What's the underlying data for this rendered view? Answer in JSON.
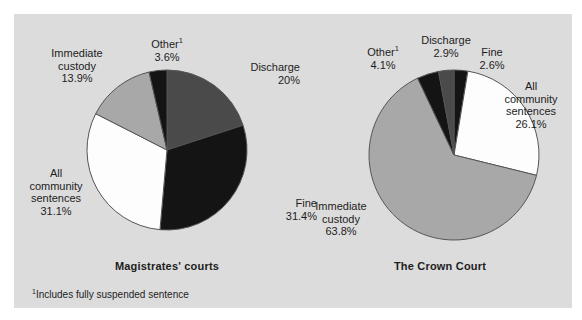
{
  "figure": {
    "background_color": "#dcdcdc",
    "page_color": "#ffffff",
    "footnote_marker": "1",
    "footnote_text": "Includes fully suspended sentence"
  },
  "palette": {
    "black": "#141414",
    "dark_gray": "#4a4a4a",
    "light_gray": "#a8a8a8",
    "white": "#fdfdfd",
    "outline": "#555555",
    "text": "#1d1d1d"
  },
  "chart_data": [
    {
      "type": "pie",
      "title": "Magistrates' courts",
      "start_angle": 0,
      "direction": "clockwise",
      "categories": [
        "Discharge",
        "Fine",
        "All community sentences",
        "Immediate custody",
        "Other"
      ],
      "values": [
        20.0,
        31.4,
        31.1,
        13.9,
        3.6
      ],
      "slices": [
        {
          "label": "Discharge",
          "value": 20.0,
          "display": "20%",
          "color": "#4a4a4a",
          "footnote": false
        },
        {
          "label": "Fine",
          "value": 31.4,
          "display": "31.4%",
          "color": "#141414",
          "footnote": false
        },
        {
          "label": "All community sentences",
          "value": 31.1,
          "display": "31.1%",
          "color": "#fdfdfd",
          "footnote": false
        },
        {
          "label": "Immediate custody",
          "value": 13.9,
          "display": "13.9%",
          "color": "#a8a8a8",
          "footnote": false
        },
        {
          "label": "Other",
          "value": 3.6,
          "display": "3.6%",
          "color": "#141414",
          "footnote": true
        }
      ],
      "labels": {
        "other_name": "Other",
        "other_pct": "3.6%",
        "immediate_custody_line1": "Immediate",
        "immediate_custody_line2": "custody",
        "immediate_custody_pct": "13.9%",
        "discharge_name": "Discharge",
        "discharge_pct": "20%",
        "fine_name": "Fine",
        "fine_pct": "31.4%",
        "community_line1": "All",
        "community_line2": "community",
        "community_line3": "sentences",
        "community_pct": "31.1%"
      }
    },
    {
      "type": "pie",
      "title": "The Crown Court",
      "start_angle": 0,
      "direction": "clockwise",
      "categories": [
        "Fine",
        "All community sentences",
        "Immediate custody",
        "Other",
        "Discharge"
      ],
      "values": [
        2.6,
        26.1,
        63.8,
        4.1,
        2.9
      ],
      "slices": [
        {
          "label": "Fine",
          "value": 2.6,
          "display": "2.6%",
          "color": "#141414",
          "footnote": false
        },
        {
          "label": "All community sentences",
          "value": 26.1,
          "display": "26.1%",
          "color": "#fdfdfd",
          "footnote": false
        },
        {
          "label": "Immediate custody",
          "value": 63.8,
          "display": "63.8%",
          "color": "#a8a8a8",
          "footnote": false
        },
        {
          "label": "Other",
          "value": 4.1,
          "display": "4.1%",
          "color": "#141414",
          "footnote": true
        },
        {
          "label": "Discharge",
          "value": 2.9,
          "display": "2.9%",
          "color": "#4a4a4a",
          "footnote": false
        }
      ],
      "labels": {
        "other_name": "Other",
        "other_pct": "4.1%",
        "discharge_name": "Discharge",
        "discharge_pct": "2.9%",
        "fine_name": "Fine",
        "fine_pct": "2.6%",
        "community_line1": "All",
        "community_line2": "community",
        "community_line3": "sentences",
        "community_pct": "26.1%",
        "immediate_custody_line1": "Immediate",
        "immediate_custody_line2": "custody",
        "immediate_custody_pct": "63.8%"
      }
    }
  ]
}
